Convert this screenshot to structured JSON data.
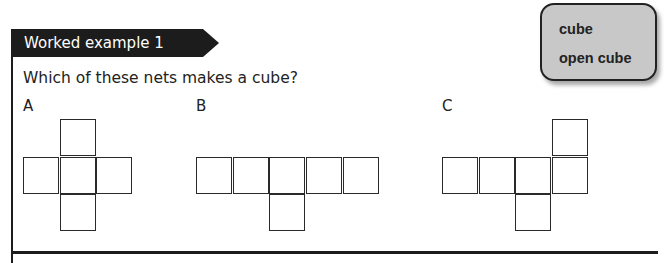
{
  "header": {
    "title": "Worked example 1"
  },
  "question": "Which of these nets makes a cube?",
  "keywords": {
    "items": [
      "cube",
      "open cube"
    ]
  },
  "nets": [
    {
      "label": "A",
      "squares": [
        [
          1,
          0
        ],
        [
          0,
          1
        ],
        [
          1,
          1
        ],
        [
          2,
          1
        ],
        [
          1,
          2
        ]
      ]
    },
    {
      "label": "B",
      "squares": [
        [
          0,
          1
        ],
        [
          1,
          1
        ],
        [
          2,
          1
        ],
        [
          3,
          1
        ],
        [
          4,
          1
        ],
        [
          2,
          2
        ]
      ]
    },
    {
      "label": "C",
      "squares": [
        [
          3,
          0
        ],
        [
          0,
          1
        ],
        [
          1,
          1
        ],
        [
          2,
          1
        ],
        [
          3,
          1
        ],
        [
          2,
          2
        ]
      ]
    }
  ],
  "colors": {
    "header_bg": "#1c1c1c",
    "keyword_bg": "#c8c8c8"
  }
}
